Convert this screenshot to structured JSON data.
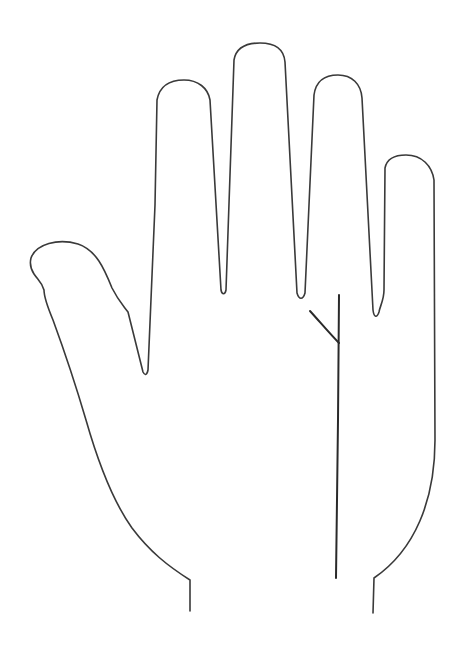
{
  "diagram": {
    "title": "Palm outline with fate line",
    "stroke_color": "#3a3a3a",
    "line_color": "#2a2a2a",
    "background": "#ffffff",
    "elements": [
      {
        "name": "hand-outline",
        "type": "outline"
      },
      {
        "name": "fate-line",
        "type": "palm-line",
        "from": [
          339,
          295
        ],
        "to": [
          336,
          578
        ]
      },
      {
        "name": "fate-line-branch",
        "type": "palm-line",
        "from": [
          310,
          311
        ],
        "to": [
          339,
          343
        ]
      }
    ]
  }
}
